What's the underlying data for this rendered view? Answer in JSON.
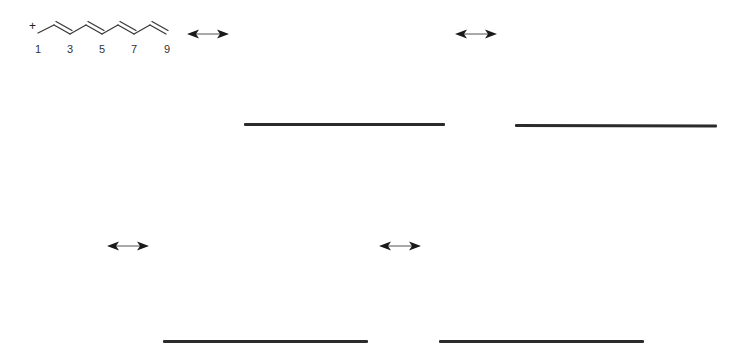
{
  "figure": {
    "molecule": {
      "charge_symbol": "+",
      "carbon_labels": [
        "1",
        "3",
        "5",
        "7",
        "9"
      ],
      "bond_color": "#3a3a3a"
    },
    "resonance_arrow_symbol": "↔",
    "rows": [
      {
        "arrows": 2,
        "blanks": 2
      },
      {
        "arrows": 2,
        "blanks": 2
      }
    ],
    "colors": {
      "line": "#2b2b2b",
      "arrow": "#1a1a1a",
      "background": "#ffffff"
    }
  }
}
